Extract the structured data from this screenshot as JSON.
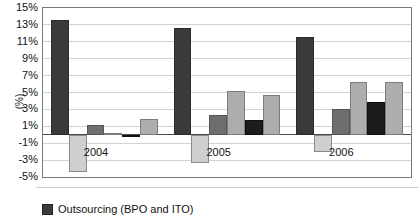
{
  "chart_data": {
    "type": "bar",
    "title": "",
    "xlabel": "",
    "ylabel": "(%)",
    "ylim": [
      -5,
      15
    ],
    "ytick_step": 2,
    "grid": true,
    "legend_position": "bottom-left",
    "categories": [
      "2004",
      "2005",
      "2006"
    ],
    "ytick_labels": [
      "15%",
      "13%",
      "11%",
      "9%",
      "7%",
      "5%",
      "3%",
      "1%",
      "-1%",
      "-3%",
      "-5%"
    ],
    "series": [
      {
        "name": "Outsourcing (BPO and ITO)",
        "color": "#3a3a3a",
        "values": [
          13.6,
          12.6,
          11.6
        ]
      },
      {
        "name": "series-2",
        "color": "#cfcfcf",
        "values": [
          -4.4,
          -3.3,
          -2.0
        ]
      },
      {
        "name": "series-3",
        "color": "#6e6e6e",
        "values": [
          1.1,
          2.3,
          3.1
        ]
      },
      {
        "name": "series-4",
        "color": "#adadad",
        "values": [
          0.15,
          5.2,
          6.3
        ]
      },
      {
        "name": "series-5",
        "color": "#1c1c1c",
        "values": [
          0.0,
          1.7,
          3.9
        ]
      },
      {
        "name": "series-6",
        "color": "#adadad",
        "values": [
          1.9,
          4.7,
          6.3
        ]
      }
    ],
    "group_label_text": [
      "2004",
      "2005",
      "2006"
    ]
  },
  "axis": {
    "y_title": "(%)"
  },
  "legend": {
    "entries": [
      {
        "label": "Outsourcing (BPO and ITO)",
        "color": "#3a3a3a"
      }
    ]
  }
}
